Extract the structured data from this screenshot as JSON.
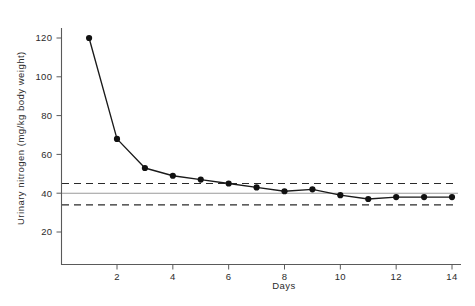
{
  "chart_data": {
    "type": "line",
    "title": "",
    "xlabel": "Days",
    "ylabel": "Urinary nitrogen (mg/kg body weight)",
    "xlim": [
      0,
      14.6
    ],
    "ylim": [
      14,
      128
    ],
    "grid": false,
    "legend": "none",
    "x": [
      1,
      2,
      3,
      4,
      5,
      6,
      7,
      8,
      9,
      10,
      11,
      12,
      13,
      14
    ],
    "xticks": [
      2,
      4,
      6,
      8,
      10,
      12,
      14
    ],
    "xticklabels": [
      "2",
      "4",
      "6",
      "8",
      "10",
      "12",
      "14"
    ],
    "yticks": [
      20,
      40,
      60,
      80,
      100,
      120
    ],
    "yticklabels": [
      "20",
      "40",
      "60",
      "80",
      "100",
      "120"
    ],
    "series": [
      {
        "name": "Urinary nitrogen",
        "marker": "filled-circle",
        "values": [
          120,
          68,
          53,
          49,
          47,
          45,
          43,
          41,
          42,
          39,
          37,
          38,
          38,
          38
        ]
      }
    ],
    "reference_lines": [
      {
        "name": "upper-dashed",
        "value": 45,
        "style": "dashed"
      },
      {
        "name": "mean-solid",
        "value": 40,
        "style": "solid"
      },
      {
        "name": "lower-dashed",
        "value": 34,
        "style": "dashed"
      }
    ]
  },
  "axes": {
    "y_title": "Urinary nitrogen (mg/kg body weight)",
    "x_title": "Days"
  },
  "colors": {
    "line": "#1a1a1a",
    "marker": "#111111",
    "axis": "#5a5a5a",
    "reference_dashed": "#2a2a2a",
    "reference_solid": "#9a9a9a",
    "background": "#ffffff"
  }
}
